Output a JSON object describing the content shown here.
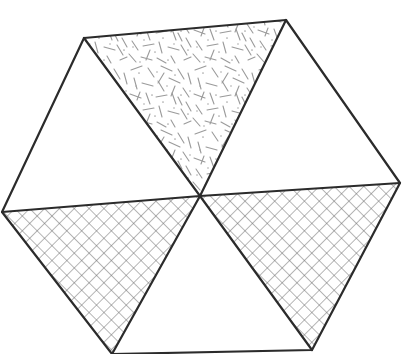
{
  "canvas": {
    "width": 407,
    "height": 354,
    "background_color": "#ffffff"
  },
  "figure": {
    "shape": "hexagon",
    "sector_count": 6,
    "outline_color": "#2b2b2b",
    "outline_width": 2.2,
    "pattern_color": "#8a8a8a",
    "crosshatch_color": "#6e6e6e"
  },
  "geometry": {
    "center": {
      "x": 200,
      "y": 196
    },
    "vertices": [
      {
        "name": "top-left",
        "x": 84,
        "y": 38
      },
      {
        "name": "top-right",
        "x": 286,
        "y": 20
      },
      {
        "name": "right",
        "x": 400,
        "y": 183
      },
      {
        "name": "bottom-right",
        "x": 312,
        "y": 350
      },
      {
        "name": "bottom-left",
        "x": 112,
        "y": 354
      },
      {
        "name": "left",
        "x": 2,
        "y": 212
      }
    ]
  },
  "sectors": [
    {
      "id": "sector-upper-left",
      "label": "Upper left triangle",
      "fill": "plain",
      "fill_color": "#ffffff",
      "points": "200,196 84,38 286,20",
      "visible_points": "200,196 2,212 84,38"
    },
    {
      "id": "sector-upper-center",
      "label": "Upper center triangle",
      "fill": "sticks",
      "fill_color": "#ffffff",
      "points": "200,196 84,38 286,20"
    },
    {
      "id": "sector-upper-right",
      "label": "Upper right triangle",
      "fill": "plain",
      "fill_color": "#ffffff",
      "points": "200,196 286,20 400,183"
    },
    {
      "id": "sector-lower-right",
      "label": "Lower right triangle",
      "fill": "crosshatch",
      "fill_color": "#ffffff",
      "points": "200,196 400,183 312,350"
    },
    {
      "id": "sector-bottom-center",
      "label": "Bottom center triangle (clipped by frame)",
      "fill": "plain",
      "fill_color": "#ffffff",
      "points": "200,196 312,350 112,354"
    },
    {
      "id": "sector-lower-left",
      "label": "Lower left triangle",
      "fill": "crosshatch",
      "fill_color": "#ffffff",
      "points": "200,196 112,354 2,212"
    }
  ],
  "patterns": {
    "sticks": {
      "name": "random-sticks-pattern",
      "description": "Short randomly oriented line segments with scattered dots",
      "segment_length_px": [
        7,
        15
      ],
      "stroke_width": 1.1,
      "color": "#9a9a9a",
      "dot_color": "#a8a8a8"
    },
    "crosshatch": {
      "name": "diagonal-crosshatch-pattern",
      "description": "Two families of parallel lines at plus and minus 45 degrees",
      "spacing_px": 10.5,
      "stroke_width": 1.0,
      "color": "#6e6e6e"
    }
  },
  "interior_edges": [
    {
      "name": "edge-center-to-top-left",
      "from": "center",
      "to": "top-left"
    },
    {
      "name": "edge-center-to-top-right",
      "from": "center",
      "to": "top-right"
    },
    {
      "name": "edge-center-to-right",
      "from": "center",
      "to": "right"
    },
    {
      "name": "edge-center-to-bottom-right",
      "from": "center",
      "to": "bottom-right"
    },
    {
      "name": "edge-center-to-bottom-left",
      "from": "center",
      "to": "bottom-left"
    },
    {
      "name": "edge-center-to-left",
      "from": "center",
      "to": "left"
    }
  ]
}
